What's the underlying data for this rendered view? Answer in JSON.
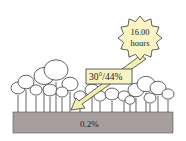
{
  "diagram": {
    "sun": {
      "time_line1": "16.00",
      "time_line2": "hours"
    },
    "arrow_label": "30°/44%",
    "ground_label": "0.2%",
    "colors": {
      "sun_fill": "#fbf5c4",
      "arrow_fill": "#f2efb0",
      "label_box_fill": "#f7f3c2",
      "ground_fill": "#a89e9e",
      "outline": "#222222"
    }
  }
}
